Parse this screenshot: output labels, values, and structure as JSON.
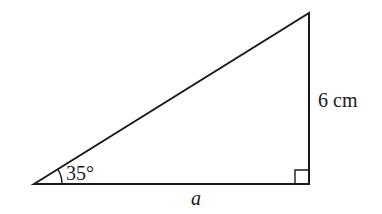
{
  "diagram": {
    "type": "right-triangle",
    "angle_label": "35°",
    "opposite_side_label": "6 cm",
    "adjacent_side_label": "a",
    "right_angle_marker": true,
    "stroke_color": "#1a1a1a"
  }
}
